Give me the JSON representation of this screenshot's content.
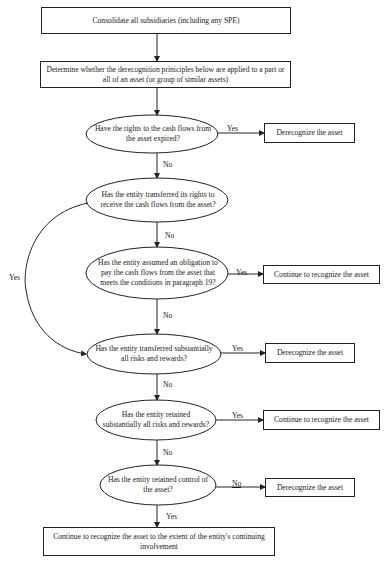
{
  "diagram": {
    "type": "flowchart",
    "nodes": {
      "consolidate": "Consolidate all subsidiaries (including any SPE)",
      "determine": "Determine whether the derecognition priniciples below are applied to a part or all of an asset (or group of similar assets)",
      "q1": "Have the rights to the cash flows from the asset expired?",
      "r1": "Derecognize the asset",
      "q2": "Has the entity transferred its rights to receive the cash flows from the asset?",
      "q3": "Has the entity assumed an obligation to pay the cash flows from the asset that meets the conditions in paragraph 19?",
      "r3": "Continue to recognize the asset",
      "q4": "Has the entity transferred substantially all risks and rewards?",
      "r4": "Derecognize the asset",
      "q5": "Has the entity retained substantially all risks and rewards?",
      "r5": "Continue to recognize the asset",
      "q6": "Has the entity retained control of the asset?",
      "r6": "Derecognize the asset",
      "final": "Continue to recognize the asset to the extent of the entity's continuing involvement"
    },
    "edge_labels": {
      "q1_yes": "Yes",
      "q1_no": "No",
      "q2_yes": "Yes",
      "q2_no": "No",
      "q3_yes": "Yes",
      "q3_no": "No",
      "q4_yes": "Yes",
      "q4_no": "No",
      "q5_yes": "Yes",
      "q5_no": "No",
      "q6_no": "No",
      "q6_yes": "Yes"
    },
    "edges": [
      {
        "from": "consolidate",
        "to": "determine",
        "label": ""
      },
      {
        "from": "determine",
        "to": "q1",
        "label": ""
      },
      {
        "from": "q1",
        "to": "r1",
        "label": "Yes"
      },
      {
        "from": "q1",
        "to": "q2",
        "label": "No"
      },
      {
        "from": "q2",
        "to": "q4",
        "label": "Yes"
      },
      {
        "from": "q2",
        "to": "q3",
        "label": "No"
      },
      {
        "from": "q3",
        "to": "r3",
        "label": "Yes"
      },
      {
        "from": "q3",
        "to": "q4",
        "label": "No"
      },
      {
        "from": "q4",
        "to": "r4",
        "label": "Yes"
      },
      {
        "from": "q4",
        "to": "q5",
        "label": "No"
      },
      {
        "from": "q5",
        "to": "r5",
        "label": "Yes"
      },
      {
        "from": "q5",
        "to": "q6",
        "label": "No"
      },
      {
        "from": "q6",
        "to": "r6",
        "label": "No"
      },
      {
        "from": "q6",
        "to": "final",
        "label": "Yes"
      }
    ]
  }
}
